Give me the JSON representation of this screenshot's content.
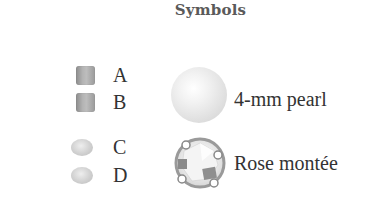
{
  "title": "Symbols",
  "beads": [
    {
      "label": "A",
      "shape": "square-bead-icon"
    },
    {
      "label": "B",
      "shape": "square-bead-icon"
    },
    {
      "label": "C",
      "shape": "oval-bead-icon"
    },
    {
      "label": "D",
      "shape": "oval-bead-icon"
    }
  ],
  "components": [
    {
      "label": "4-mm pearl",
      "shape": "pearl-icon"
    },
    {
      "label": "Rose montée",
      "shape": "rose-montee-icon"
    }
  ],
  "colors": {
    "title": "#5a5a5a",
    "text": "#333333",
    "bead_gray": "#a8a8a8",
    "pearl_white": "#f2f2f2"
  }
}
